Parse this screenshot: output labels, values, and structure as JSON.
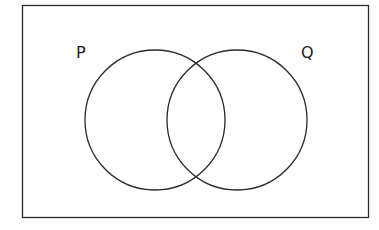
{
  "diagram": {
    "type": "venn",
    "universal_set": {
      "x": 22,
      "y": 5,
      "width": 346,
      "height": 212,
      "label": ""
    },
    "sets": [
      {
        "label": "P",
        "cx": 155,
        "cy": 120,
        "r": 70,
        "label_x": 76,
        "label_y": 58
      },
      {
        "label": "Q",
        "cx": 237,
        "cy": 120,
        "r": 70,
        "label_x": 301,
        "label_y": 58
      }
    ],
    "stroke_color": "#2a2a2a"
  }
}
